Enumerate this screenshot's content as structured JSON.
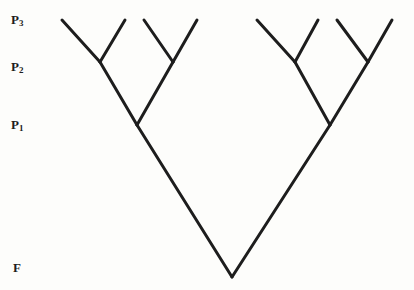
{
  "figure": {
    "type": "pedigree-tree-diagram",
    "background_color": "#fdfdfb",
    "line_color": "#1d1d1d",
    "line_width": 3,
    "width": 414,
    "height": 290
  },
  "generation_labels": [
    {
      "id": "p3",
      "base": "P",
      "subscript": "3",
      "full": "P3",
      "y": 20
    },
    {
      "id": "p2",
      "base": "P",
      "subscript": "2",
      "full": "P2",
      "y": 66
    },
    {
      "id": "p1",
      "base": "P",
      "subscript": "1",
      "full": "P1",
      "y": 125
    },
    {
      "id": "f",
      "base": "F",
      "subscript": "",
      "full": "F",
      "y": 277
    }
  ],
  "tree": {
    "levels": {
      "p3_y": 20,
      "p2_y": 62,
      "p1_y": 125,
      "f_y": 277
    },
    "apex": {
      "x": 232,
      "y": 277
    },
    "p1_nodes": [
      {
        "x": 137,
        "y": 125
      },
      {
        "x": 330,
        "y": 125
      }
    ],
    "p2_nodes": [
      {
        "x": 100,
        "y": 62
      },
      {
        "x": 173,
        "y": 62
      },
      {
        "x": 295,
        "y": 62
      },
      {
        "x": 368,
        "y": 62
      }
    ],
    "p3_tips": [
      {
        "x": 62,
        "y": 20
      },
      {
        "x": 125,
        "y": 20
      },
      {
        "x": 144,
        "y": 20
      },
      {
        "x": 197,
        "y": 20
      },
      {
        "x": 257,
        "y": 20
      },
      {
        "x": 318,
        "y": 20
      },
      {
        "x": 337,
        "y": 20
      },
      {
        "x": 392,
        "y": 20
      }
    ],
    "edges": [
      {
        "name": "apex-to-p1-left",
        "x1": 232,
        "y1": 277,
        "x2": 137,
        "y2": 125
      },
      {
        "name": "apex-to-p1-right",
        "x1": 232,
        "y1": 277,
        "x2": 330,
        "y2": 125
      },
      {
        "name": "p1left-to-p2-a",
        "x1": 137,
        "y1": 125,
        "x2": 100,
        "y2": 62
      },
      {
        "name": "p1left-to-p2-b",
        "x1": 137,
        "y1": 125,
        "x2": 173,
        "y2": 62
      },
      {
        "name": "p1right-to-p2-c",
        "x1": 330,
        "y1": 125,
        "x2": 295,
        "y2": 62
      },
      {
        "name": "p1right-to-p2-d",
        "x1": 330,
        "y1": 125,
        "x2": 368,
        "y2": 62
      },
      {
        "name": "p2a-to-tip-1",
        "x1": 100,
        "y1": 62,
        "x2": 62,
        "y2": 20
      },
      {
        "name": "p2a-to-tip-2",
        "x1": 100,
        "y1": 62,
        "x2": 125,
        "y2": 20
      },
      {
        "name": "p2b-to-tip-3",
        "x1": 173,
        "y1": 62,
        "x2": 144,
        "y2": 20
      },
      {
        "name": "p2b-to-tip-4",
        "x1": 173,
        "y1": 62,
        "x2": 197,
        "y2": 20
      },
      {
        "name": "p2c-to-tip-5",
        "x1": 295,
        "y1": 62,
        "x2": 257,
        "y2": 20
      },
      {
        "name": "p2c-to-tip-6",
        "x1": 295,
        "y1": 62,
        "x2": 318,
        "y2": 20
      },
      {
        "name": "p2d-to-tip-7",
        "x1": 368,
        "y1": 62,
        "x2": 337,
        "y2": 20
      },
      {
        "name": "p2d-to-tip-8",
        "x1": 368,
        "y1": 62,
        "x2": 392,
        "y2": 20
      }
    ]
  }
}
